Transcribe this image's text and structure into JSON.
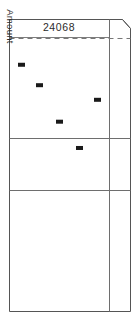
{
  "figure": {
    "title": "24068",
    "axis_label": "Amount",
    "background_color": "#ffffff",
    "frame_color": "#555555",
    "divider_color": "#6e6e6e",
    "dashed_line_color": "#777777",
    "marker_color": "#1a1a1a",
    "text_color": "#2b2b2b"
  },
  "chart_data": {
    "type": "scatter",
    "title": "24068",
    "xlabel": "",
    "ylabel": "Amount",
    "grid": false,
    "legend": false,
    "xlim": [
      0,
      1
    ],
    "ylim": [
      0,
      1
    ],
    "panel_bands": [
      {
        "name": "upper-band",
        "y_top": 0.0,
        "y_bottom": 0.36
      },
      {
        "name": "middle-band",
        "y_top": 0.36,
        "y_bottom": 0.54
      },
      {
        "name": "lower-band",
        "y_top": 0.54,
        "y_bottom": 1.0
      }
    ],
    "reference_line": {
      "style": "dashed",
      "orientation": "horizontal",
      "y": 0.055
    },
    "points": [
      {
        "x": 0.12,
        "y": 0.155
      },
      {
        "x": 0.3,
        "y": 0.225
      },
      {
        "x": 0.5,
        "y": 0.35
      },
      {
        "x": 0.7,
        "y": 0.44
      },
      {
        "x": 0.88,
        "y": 0.275
      }
    ],
    "marker": {
      "shape": "rectangle",
      "width_px": 7,
      "height_px": 4,
      "color": "#1a1a1a"
    }
  }
}
